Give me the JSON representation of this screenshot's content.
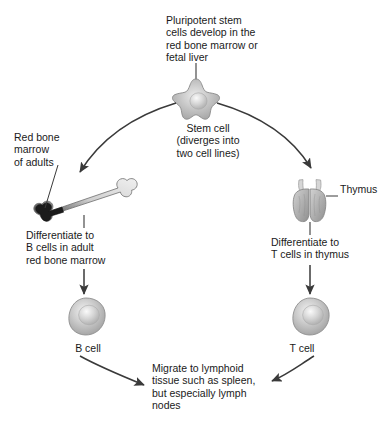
{
  "diagram": {
    "captions": {
      "top": "Pluripotent stem\ncells develop in the\nred bone marrow or\nfetal liver",
      "stem_cell": "Stem cell\n(diverges into\ntwo cell lines)",
      "red_bone_marrow": "Red bone\nmarrow\nof adults",
      "b_cell_path": "Differentiate to\nB cells in adult\nred bone marrow",
      "t_cell_path": "Differentiate to\nT cells in thymus",
      "thymus": "Thymus",
      "b_cell": "B cell",
      "t_cell": "T cell",
      "migrate": "Migrate to lymphoid\ntissue such as spleen,\nbut especially lymph\nnodes"
    },
    "colors": {
      "text": "#1a1a1a",
      "arrow": "#3a3a3a",
      "cell_fill": "#b9b9b9",
      "cell_highlight": "#e4e4e4",
      "cell_outline": "#7d7d7d",
      "bone_light": "#ededed",
      "bone_marrow_dark": "#1b1b1b",
      "thymus_fill": "#b0b0b0",
      "background": "#ffffff"
    },
    "structures": [
      {
        "name": "stem-cell",
        "shape": "star",
        "label": "Stem cell"
      },
      {
        "name": "femur-bone",
        "shape": "long-bone",
        "label": "Red bone marrow of adults"
      },
      {
        "name": "thymus-gland",
        "shape": "bilobed-gland",
        "label": "Thymus"
      },
      {
        "name": "b-cell",
        "shape": "sphere",
        "label": "B cell"
      },
      {
        "name": "t-cell",
        "shape": "sphere",
        "label": "T cell"
      }
    ],
    "connections": [
      {
        "name": "top-caption-to-stem-cell",
        "type": "leader-line"
      },
      {
        "name": "stem-cell-to-bone",
        "type": "curved-arrow"
      },
      {
        "name": "stem-cell-to-thymus",
        "type": "curved-arrow"
      },
      {
        "name": "bone-to-bcell",
        "type": "straight-arrow"
      },
      {
        "name": "thymus-to-tcell",
        "type": "straight-arrow"
      },
      {
        "name": "bcell-to-migrate",
        "type": "curved-arrow"
      },
      {
        "name": "tcell-to-migrate",
        "type": "curved-arrow"
      },
      {
        "name": "marrow-label-leader",
        "type": "leader-line"
      },
      {
        "name": "thymus-label-leader",
        "type": "leader-line"
      }
    ]
  }
}
